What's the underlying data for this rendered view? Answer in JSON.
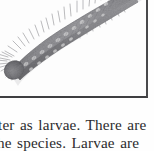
{
  "page": {
    "kind": "scanned-book-page-fragment",
    "background_color": "#fefefe",
    "ink_color": "#2b2b2d"
  },
  "figure": {
    "frame": {
      "border_color": "#444446",
      "plate_background": "#fdfdfd",
      "has_left_border": false,
      "has_top_border": false,
      "has_right_border": true,
      "has_bottom_border": true
    },
    "illustration": {
      "subject": "hairy caterpillar larva",
      "icon_name": "caterpillar-illustration",
      "style": "grayscale engraving / halftone photograph",
      "orientation": "diagonal, head at lower-left, body exiting top-right of frame",
      "body_color": "#8c8c90",
      "body_shadow_color": "#5e5e62",
      "bristle_color": "#6d6d71",
      "spot_color": "#dcdcdc"
    },
    "caption": ""
  },
  "body_text": {
    "line_1": "ter as larvae. There are",
    "line_2": "he species. Larvae are",
    "line_2_clipped": true,
    "full_visible_text": "ter as larvae. There are he species. Larvae are"
  }
}
